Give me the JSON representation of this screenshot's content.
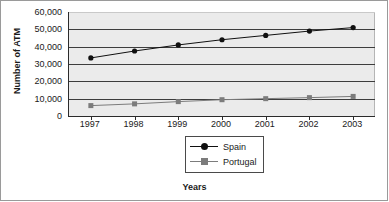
{
  "chart_data": {
    "type": "line",
    "title": "",
    "xlabel": "Years",
    "ylabel": "Number of ATM",
    "categories": [
      "1997",
      "1998",
      "1999",
      "2000",
      "2001",
      "2002",
      "2003"
    ],
    "series": [
      {
        "name": "Spain",
        "marker": "diamond",
        "color": "#101010",
        "values": [
          33500,
          37500,
          41000,
          44000,
          46500,
          49000,
          51000
        ]
      },
      {
        "name": "Portugal",
        "marker": "square",
        "color": "#7c7c7c",
        "values": [
          6000,
          7000,
          8300,
          9400,
          10000,
          10600,
          11300
        ]
      }
    ],
    "ylim": [
      0,
      60000
    ],
    "yticks": [
      "0",
      "10,000",
      "20,000",
      "30,000",
      "40,000",
      "50,000",
      "60,000"
    ],
    "ytick_values": [
      0,
      10000,
      20000,
      30000,
      40000,
      50000,
      60000
    ],
    "grid": true,
    "legend_position": "bottom-center",
    "plot_background": "#ebebeb",
    "axis_color": "#2b2b2b",
    "gridline_color": "#3d3d3d"
  },
  "legend": {
    "entries": [
      {
        "label": "Spain"
      },
      {
        "label": "Portugal"
      }
    ]
  }
}
